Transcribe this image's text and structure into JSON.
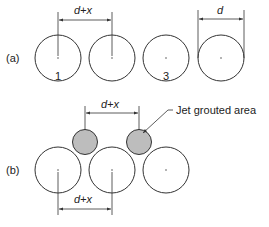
{
  "figure": {
    "panel_a": {
      "label": "(a)",
      "piles": [
        {
          "id": "1",
          "label": "1"
        },
        {
          "id": "2",
          "label": ""
        },
        {
          "id": "3",
          "label": "3"
        },
        {
          "id": "4",
          "label": ""
        }
      ],
      "dimensions": {
        "spacing": "d+x",
        "diameter": "d"
      }
    },
    "panel_b": {
      "label": "(b)",
      "piles": [
        {
          "id": "1"
        },
        {
          "id": "2"
        },
        {
          "id": "3"
        }
      ],
      "grout_columns": [
        {
          "id": "g1"
        },
        {
          "id": "g2"
        }
      ],
      "dimensions": {
        "top_spacing": "d+x",
        "bottom_spacing": "d+x"
      },
      "callout": "Jet grouted area"
    },
    "colors": {
      "stroke": "#333333",
      "grout_fill": "#bdbdbd",
      "background": "#ffffff"
    }
  }
}
